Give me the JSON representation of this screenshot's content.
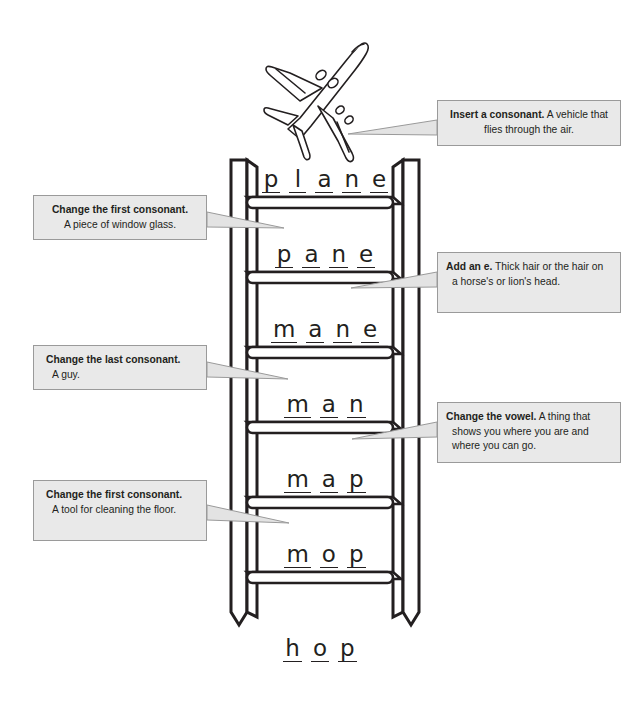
{
  "page": {
    "background_color": "#ffffff",
    "ink_color": "#231f20",
    "callout_fill": "#e9e9e9",
    "callout_border": "#9a9a9a"
  },
  "illustration": {
    "name": "airplane",
    "label": "airplane line drawing"
  },
  "ladder": {
    "rung_count": 6,
    "rungs": [
      {
        "index": 0,
        "word": "plane",
        "letters": [
          "p",
          "l",
          "a",
          "n",
          "e"
        ]
      },
      {
        "index": 1,
        "word": "pane",
        "letters": [
          "p",
          "a",
          "n",
          "e"
        ]
      },
      {
        "index": 2,
        "word": "mane",
        "letters": [
          "m",
          "a",
          "n",
          "e"
        ]
      },
      {
        "index": 3,
        "word": "man",
        "letters": [
          "m",
          "a",
          "n"
        ]
      },
      {
        "index": 4,
        "word": "map",
        "letters": [
          "m",
          "a",
          "p"
        ]
      },
      {
        "index": 5,
        "word": "mop",
        "letters": [
          "m",
          "o",
          "p"
        ]
      }
    ],
    "base_word": {
      "word": "hop",
      "letters": [
        "h",
        "o",
        "p"
      ]
    }
  },
  "callouts": [
    {
      "id": "plane",
      "side": "right",
      "lead": "Insert a consonant.",
      "body": "A vehicle that flies through the air.",
      "line1": "Insert a consonant. A vehicle",
      "line2": "that flies through the air."
    },
    {
      "id": "pane",
      "side": "left",
      "lead": "Change the first consonant.",
      "body": "A piece of window glass.",
      "line1": "Change the first consonant.",
      "line2": "A piece of window glass."
    },
    {
      "id": "mane",
      "side": "right",
      "lead": "Add an e.",
      "body": "Thick hair or the hair on a horse's or lion's head.",
      "line1": "Add an e. Thick hair or the",
      "line2": "hair on a horse's or lion's",
      "line3": "head."
    },
    {
      "id": "man",
      "side": "left",
      "lead": "Change the last consonant.",
      "body": "A guy.",
      "line1": "Change the last consonant.",
      "line2": "A guy."
    },
    {
      "id": "map",
      "side": "right",
      "lead": "Change the vowel.",
      "body": "A thing that shows you where you are and where you can go.",
      "line1": "Change the vowel. A thing",
      "line2": "that shows you where you",
      "line3": "are and where you can go."
    },
    {
      "id": "mop",
      "side": "left",
      "lead": "Change the first consonant.",
      "body": "A tool for cleaning the floor.",
      "line1": "Change the first consonant.",
      "line2": "A tool for cleaning the",
      "line3": "floor."
    }
  ]
}
